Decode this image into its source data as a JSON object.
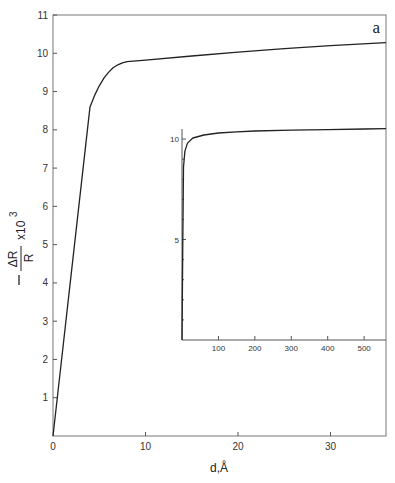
{
  "chart_data": [
    {
      "type": "line",
      "name": "main",
      "panel_label": "a",
      "xlabel": "d,Å",
      "ylabel": "−ΔR/R x10³",
      "ylabel_parts": {
        "num": "ΔR",
        "den": "R",
        "factor": "x10",
        "exp": "3"
      },
      "xlim": [
        0,
        36
      ],
      "ylim": [
        0,
        11
      ],
      "xticks": [
        0,
        10,
        20,
        30
      ],
      "yticks": [
        1,
        2,
        3,
        4,
        5,
        6,
        7,
        8,
        9,
        10,
        11
      ],
      "grid": false,
      "series": [
        {
          "name": "curve",
          "x": [
            0,
            2,
            4,
            4.5,
            5,
            5.5,
            6,
            6.5,
            7,
            7.5,
            8,
            10,
            15,
            20,
            25,
            30,
            36
          ],
          "y": [
            0,
            4.3,
            8.6,
            8.9,
            9.15,
            9.35,
            9.5,
            9.62,
            9.7,
            9.75,
            9.78,
            9.82,
            9.93,
            10.03,
            10.12,
            10.2,
            10.28
          ]
        }
      ]
    },
    {
      "type": "line",
      "name": "inset",
      "xlim": [
        0,
        560
      ],
      "ylim": [
        0,
        10.5
      ],
      "xticks": [
        100,
        200,
        300,
        400,
        500
      ],
      "yticks": [
        5,
        10
      ],
      "grid": false,
      "series": [
        {
          "name": "curve",
          "x": [
            0,
            2,
            4,
            8,
            15,
            30,
            60,
            100,
            150,
            200,
            300,
            400,
            500,
            560
          ],
          "y": [
            0,
            4.3,
            8.6,
            9.4,
            9.8,
            10.05,
            10.2,
            10.3,
            10.36,
            10.4,
            10.44,
            10.47,
            10.5,
            10.52
          ]
        }
      ]
    }
  ]
}
